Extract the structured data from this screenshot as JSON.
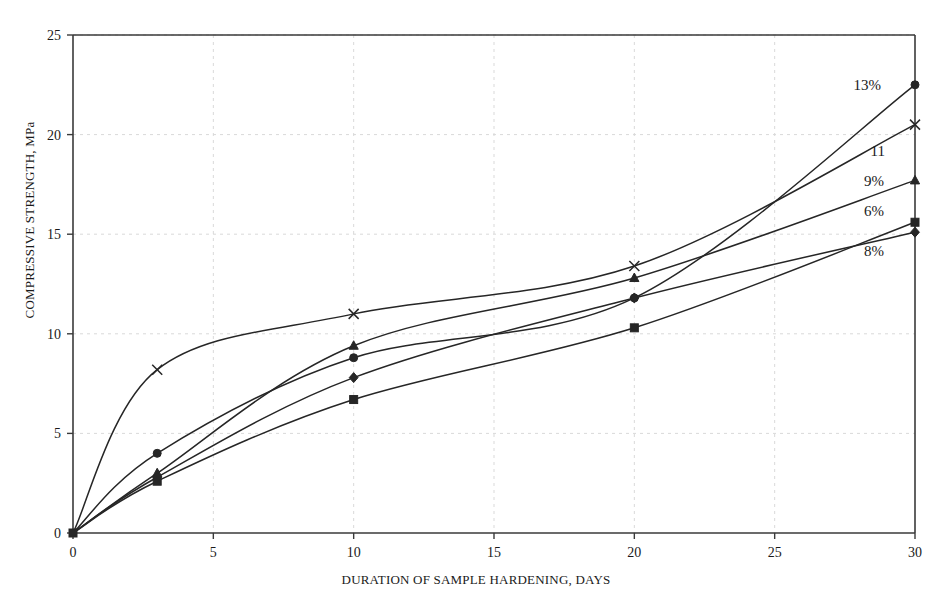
{
  "chart_data": {
    "type": "line",
    "title": "",
    "xlabel": "DURATION OF SAMPLE HARDENING, DAYS",
    "ylabel": "COMPRESSIVE STRENGTH, MPa",
    "xlim": [
      0,
      30
    ],
    "ylim": [
      0,
      25
    ],
    "xticks": [
      0,
      5,
      10,
      15,
      20,
      25,
      30
    ],
    "yticks": [
      0,
      5,
      10,
      15,
      20,
      25
    ],
    "grid": true,
    "grid_style": "dashed-light",
    "legend_position": "inline-right-end-labels",
    "x": [
      0,
      3,
      10,
      20,
      30
    ],
    "series": [
      {
        "name": "13%",
        "label": "13%",
        "marker": "circle",
        "color": "#262626",
        "values": [
          0,
          4.0,
          8.8,
          11.8,
          22.5
        ]
      },
      {
        "name": "11",
        "label": "11",
        "marker": "cross",
        "color": "#262626",
        "values": [
          0,
          8.2,
          11.0,
          13.4,
          20.5
        ]
      },
      {
        "name": "9%",
        "label": "9%",
        "marker": "triangle",
        "color": "#262626",
        "values": [
          0,
          3.0,
          9.4,
          12.8,
          17.7
        ]
      },
      {
        "name": "6%",
        "label": "6%",
        "marker": "square",
        "color": "#262626",
        "values": [
          0,
          2.6,
          6.7,
          10.3,
          15.6
        ]
      },
      {
        "name": "8%",
        "label": "8%",
        "marker": "diamond",
        "color": "#262626",
        "values": [
          0,
          2.8,
          7.8,
          11.8,
          15.1
        ]
      }
    ],
    "end_labels": [
      {
        "text": "13%",
        "x": 881,
        "y": 90
      },
      {
        "text": "11",
        "x": 885,
        "y": 156
      },
      {
        "text": "9%",
        "x": 884,
        "y": 186
      },
      {
        "text": "6%",
        "x": 884,
        "y": 216
      },
      {
        "text": "8%",
        "x": 884,
        "y": 256
      }
    ],
    "axis_color": "#3a3a3a",
    "grid_color": "#d9d9d9",
    "background": "#ffffff"
  }
}
